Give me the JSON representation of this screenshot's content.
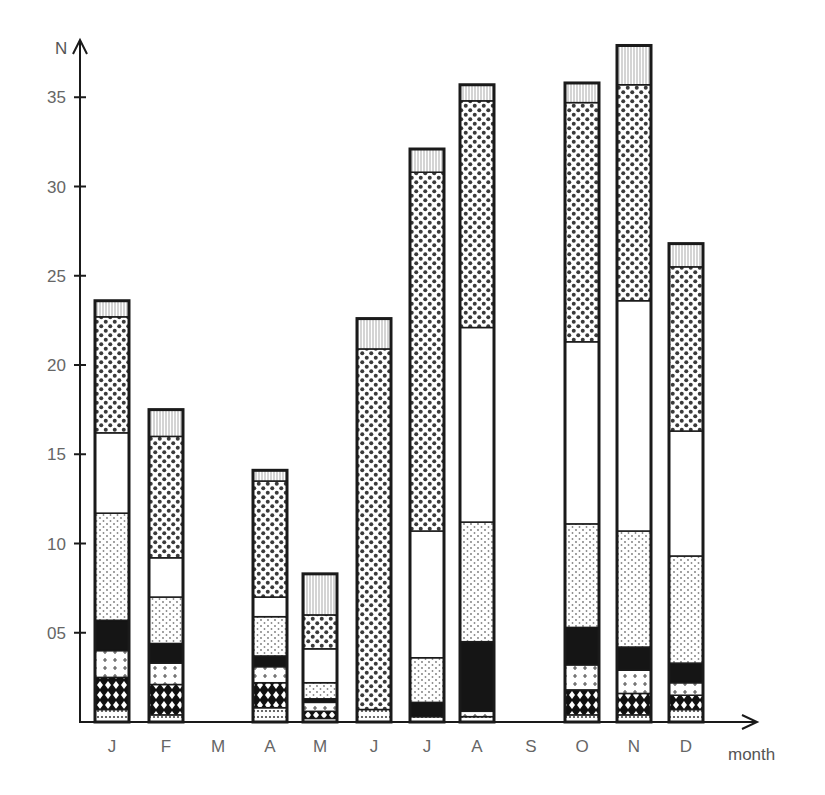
{
  "chart_data": {
    "type": "bar",
    "stacked": true,
    "title": "",
    "xlabel": "month",
    "ylabel": "N",
    "ylim": [
      0,
      38
    ],
    "yticks": [
      5,
      10,
      15,
      20,
      25,
      30,
      35
    ],
    "ytick_labels": [
      "05",
      "10",
      "15",
      "20",
      "25",
      "30",
      "35"
    ],
    "categories": [
      "J",
      "F",
      "M",
      "A",
      "M",
      "J",
      "J",
      "A",
      "S",
      "O",
      "N",
      "D"
    ],
    "legend": "none",
    "grid": false,
    "series": [
      {
        "name": "layer-1-light-dots",
        "pattern": "sparse-dots",
        "values": [
          0.7,
          0.4,
          0,
          0.8,
          0.2,
          0.7,
          0.3,
          0.3,
          0,
          0.4,
          0.4,
          0.7
        ]
      },
      {
        "name": "layer-2-diamonds",
        "pattern": "black-diamonds",
        "values": [
          1.8,
          1.7,
          0,
          1.4,
          0.4,
          0,
          0,
          0,
          0,
          1.4,
          1.2,
          0.8
        ]
      },
      {
        "name": "layer-3-crosses",
        "pattern": "crosses",
        "values": [
          1.5,
          1.2,
          0,
          0.9,
          0.5,
          0,
          0,
          0.3,
          0,
          1.4,
          1.3,
          0.7
        ]
      },
      {
        "name": "layer-4-solid-black",
        "pattern": "solid-black",
        "values": [
          1.7,
          1.1,
          0,
          0.6,
          0.2,
          0,
          0.8,
          3.9,
          0,
          2.1,
          1.3,
          1.1
        ]
      },
      {
        "name": "layer-5-fine-stipple",
        "pattern": "fine-stipple",
        "values": [
          6.0,
          2.6,
          0,
          2.2,
          0.9,
          0,
          2.5,
          6.7,
          0,
          5.8,
          6.5,
          6.0
        ]
      },
      {
        "name": "layer-6-white",
        "pattern": "blank",
        "values": [
          4.5,
          2.2,
          0,
          1.1,
          1.9,
          0,
          7.1,
          10.9,
          0,
          10.2,
          12.9,
          7.0
        ]
      },
      {
        "name": "layer-7-heavy-dots",
        "pattern": "heavy-dots",
        "values": [
          6.5,
          6.8,
          0,
          6.5,
          1.9,
          20.2,
          20.1,
          12.7,
          0,
          13.4,
          12.1,
          9.2
        ]
      },
      {
        "name": "layer-8-vertical-hatch",
        "pattern": "vertical-hatch",
        "values": [
          0.9,
          1.5,
          0,
          0.6,
          2.3,
          1.7,
          1.3,
          0.9,
          0,
          1.1,
          2.2,
          1.3
        ]
      }
    ],
    "totals": [
      23.6,
      17.5,
      0,
      14.1,
      8.3,
      22.6,
      32.1,
      35.7,
      0,
      35.8,
      37.9,
      26.8
    ]
  },
  "axis": {
    "y_title": "N",
    "x_title": "month"
  },
  "colors": {
    "ink": "#1a1a1a",
    "label": "#666666",
    "background": "#ffffff"
  }
}
